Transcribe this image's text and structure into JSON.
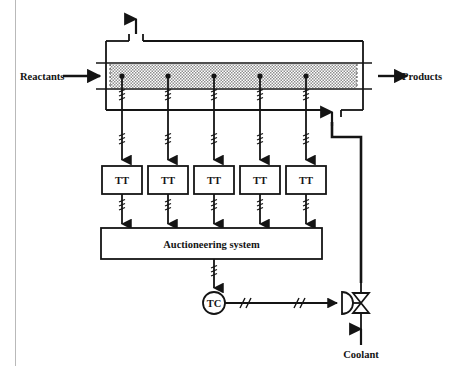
{
  "diagram": {
    "type": "process-flow-instrumentation-diagram",
    "line_color": "#141414",
    "bed_fill_color": "#c9c9c9",
    "background_color": "#ffffff",
    "labels": {
      "reactants": "Reactants",
      "products": "Products",
      "coolant": "Coolant",
      "auctioneering_system": "Auctioneering system",
      "controller": "TC",
      "vent": ""
    },
    "transmitters": [
      {
        "id": "tt-1",
        "label": "TT"
      },
      {
        "id": "tt-2",
        "label": "TT"
      },
      {
        "id": "tt-3",
        "label": "TT"
      },
      {
        "id": "tt-4",
        "label": "TT"
      },
      {
        "id": "tt-5",
        "label": "TT"
      }
    ],
    "icons": {
      "flow_arrow": "arrow-right-icon",
      "vent_arrow": "arrow-up-icon",
      "coolant_arrow": "arrow-up-icon",
      "signal_arrow": "arrow-down-icon",
      "valve": "control-valve-icon",
      "actuator": "diaphragm-actuator-icon",
      "electric_signal": "electric-signal-squiggle-icon",
      "pneumatic_signal": "pneumatic-signal-hash-icon"
    },
    "geometry": {
      "sensor_x": [
        122,
        168,
        214,
        260,
        306
      ],
      "bed_top": 63,
      "bed_bottom": 89,
      "tt_box_top": 166,
      "tt_box_height": 28,
      "tt_box_width": 40,
      "auction_box": {
        "x": 101,
        "y": 228,
        "w": 221,
        "h": 31
      },
      "tc_center": {
        "cx": 214,
        "cy": 303,
        "r": 11
      },
      "valve_center": {
        "cx": 361,
        "cy": 303
      }
    }
  }
}
